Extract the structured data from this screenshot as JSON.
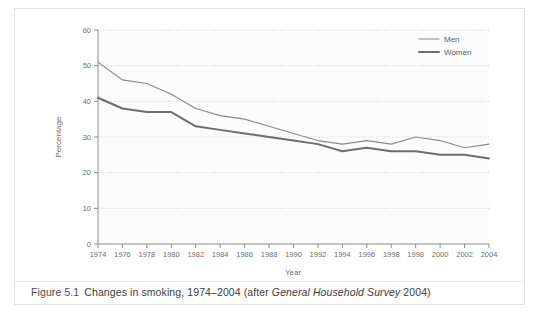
{
  "figure": {
    "label": "Figure 5.1",
    "caption_main": "Changes in smoking, 1974–2004 (after ",
    "caption_source": "General Household Survey",
    "caption_tail": " 2004)"
  },
  "chart_data": {
    "type": "line",
    "title": "",
    "xlabel": "Year",
    "ylabel": "Percentage",
    "xlim": [
      1974,
      2004
    ],
    "ylim": [
      0,
      60
    ],
    "ytick_step": 10,
    "yticks": [
      0,
      10,
      20,
      30,
      40,
      50,
      60
    ],
    "grid": true,
    "legend_position": "top-right",
    "x": [
      1974,
      1976,
      1978,
      1980,
      1982,
      1984,
      1986,
      1988,
      1990,
      1992,
      1994,
      1996,
      1998,
      1998,
      2000,
      2002,
      2004
    ],
    "tick_labels": [
      "1974",
      "1976",
      "1978",
      "1980",
      "1982",
      "1984",
      "1986",
      "1988",
      "1990",
      "1992",
      "1994",
      "1996",
      "1998",
      "1998",
      "2000",
      "2002",
      "2004"
    ],
    "series": [
      {
        "name": "Men",
        "color": "#8a8a8a",
        "values": [
          51,
          46,
          45,
          42,
          38,
          36,
          35,
          33,
          31,
          29,
          28,
          29,
          28,
          30,
          29,
          27,
          28
        ]
      },
      {
        "name": "Women",
        "color": "#6e6e6e",
        "values": [
          41,
          38,
          37,
          37,
          33,
          32,
          31,
          30,
          29,
          28,
          26,
          27,
          26,
          26,
          25,
          25,
          24
        ]
      }
    ]
  },
  "legend": {
    "entries": [
      {
        "label": "Men"
      },
      {
        "label": "Women"
      }
    ]
  }
}
